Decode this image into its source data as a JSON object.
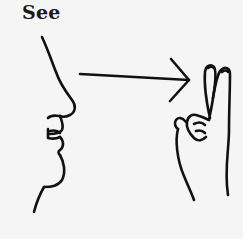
{
  "illustration": {
    "title": "See",
    "subject": "sign-language-sign",
    "elements": [
      "face-profile",
      "direction-arrow",
      "v-hand-sign"
    ],
    "ink_color": "#111111",
    "background_color": "#f5f5f5"
  }
}
